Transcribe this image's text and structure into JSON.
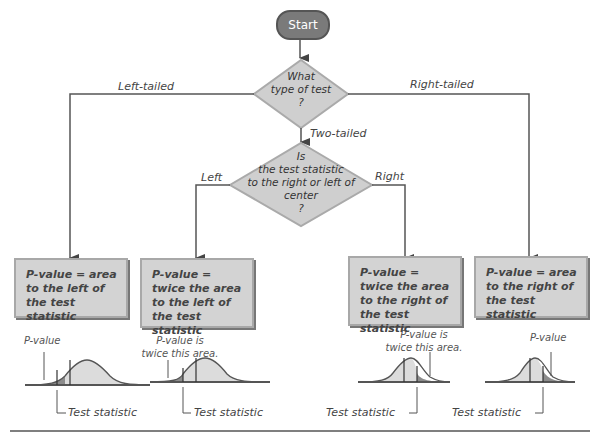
{
  "start": {
    "label": "Start"
  },
  "decision1": {
    "lines": [
      "What",
      "type of test",
      "?"
    ]
  },
  "decision2": {
    "lines": [
      "Is",
      "the test statistic",
      "to the right or left of",
      "center",
      "?"
    ]
  },
  "branches": {
    "left_tailed": "Left-tailed",
    "right_tailed": "Right-tailed",
    "two_tailed": "Two-tailed",
    "left": "Left",
    "right": "Right"
  },
  "boxes": [
    {
      "text": "P-value = area to the left of the test statistic"
    },
    {
      "text": "P-value = twice the area to the left of the test statistic"
    },
    {
      "text": "P-value = twice the area to the right of the test statistic"
    },
    {
      "text": "P-value = area to the right of the test statistic"
    }
  ],
  "curves": [
    {
      "caption": "P-value",
      "test_label": "Test statistic",
      "shade": "left"
    },
    {
      "caption": "P-value is twice this area.",
      "caption_lines": [
        "P-value is",
        "twice this area."
      ],
      "test_label": "Test statistic",
      "shade": "left"
    },
    {
      "caption": "P-value is twice this area.",
      "caption_lines": [
        "P-value is",
        "twice this area."
      ],
      "test_label": "Test statistic",
      "shade": "right"
    },
    {
      "caption": "P-value",
      "test_label": "Test statistic",
      "shade": "right"
    }
  ],
  "colors": {
    "start_fill": "#7a7a7a",
    "diamond_fill": "#cfcfcf",
    "box_fill": "#d3d3d3",
    "curve_fill": "#dcdcdc",
    "tail_fill": "#8c8c8c",
    "line": "#555555"
  }
}
